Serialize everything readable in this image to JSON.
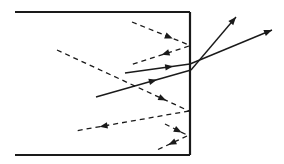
{
  "diagram": {
    "colors": {
      "line": "#1a1a1a",
      "background": "#ffffff"
    },
    "box": {
      "top": {
        "x1": 15,
        "y1": 12,
        "x2": 190,
        "y2": 12
      },
      "right": {
        "x1": 190,
        "y1": 12,
        "x2": 190,
        "y2": 155
      },
      "bottom": {
        "x1": 15,
        "y1": 155,
        "x2": 190,
        "y2": 155
      }
    },
    "dashed_rays": [
      {
        "name": "reflect-top-incident",
        "x1": 132,
        "y1": 22,
        "x2": 189,
        "y2": 45,
        "arrow_at": 0.65
      },
      {
        "name": "reflect-top-reflected",
        "x1": 189,
        "y1": 46,
        "x2": 130,
        "y2": 65,
        "arrow_at": 0.4
      },
      {
        "name": "reflect-mid-incident",
        "x1": 57,
        "y1": 50,
        "x2": 189,
        "y2": 111,
        "arrow_at": 0.8
      },
      {
        "name": "reflect-mid-reflected",
        "x1": 189,
        "y1": 111,
        "x2": 75,
        "y2": 131,
        "arrow_at": 0.75
      },
      {
        "name": "reflect-low-incident",
        "x1": 165,
        "y1": 124,
        "x2": 187,
        "y2": 135,
        "arrow_at": 0.6
      },
      {
        "name": "reflect-low-reflected",
        "x1": 187,
        "y1": 136,
        "x2": 157,
        "y2": 150,
        "arrow_at": 0.5
      }
    ],
    "solid_rays": [
      {
        "name": "refract-upper-incident",
        "x1": 125,
        "y1": 73,
        "x2": 190,
        "y2": 64,
        "arrow_at": 0.68
      },
      {
        "name": "refract-upper-exit",
        "x1": 190,
        "y1": 64,
        "x2": 272,
        "y2": 30,
        "arrow_end": true
      },
      {
        "name": "refract-lower-incident",
        "x1": 96,
        "y1": 97,
        "x2": 191,
        "y2": 70,
        "arrow_at": 0.6
      },
      {
        "name": "refract-lower-exit",
        "x1": 191,
        "y1": 70,
        "x2": 236,
        "y2": 17,
        "arrow_end": true
      }
    ]
  }
}
